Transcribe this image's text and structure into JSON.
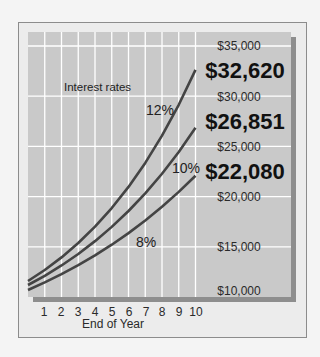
{
  "chart_data": {
    "type": "line",
    "title": "",
    "xlabel": "End of Year",
    "ylabel": "",
    "annotation": "Interest rates",
    "x": [
      0,
      1,
      2,
      3,
      4,
      5,
      6,
      7,
      8,
      9,
      10
    ],
    "x_tick_labels": [
      "1",
      "2",
      "3",
      "4",
      "5",
      "6",
      "7",
      "8",
      "9",
      "10"
    ],
    "ylim": [
      10000,
      35000
    ],
    "y_tick_labels": [
      "$35,000",
      "$30,000",
      "$25,000",
      "$20,000",
      "$15,000",
      "$10,000"
    ],
    "y_ticks": [
      35000,
      30000,
      25000,
      20000,
      15000,
      10000
    ],
    "grid": true,
    "series": [
      {
        "name": "12%",
        "values": [
          10000,
          11255,
          12668,
          14258,
          16047,
          18061,
          20328,
          22879,
          25751,
          28983,
          32620
        ],
        "final_label": "$32,620"
      },
      {
        "name": "10%",
        "values": [
          10000,
          11038,
          12184,
          13449,
          14845,
          16386,
          18087,
          19965,
          22038,
          24325,
          26851
        ],
        "final_label": "$26,851"
      },
      {
        "name": "8%",
        "values": [
          10000,
          10824,
          11717,
          12682,
          13728,
          14859,
          16084,
          17410,
          18845,
          20399,
          22080
        ],
        "final_label": "$22,080"
      }
    ]
  },
  "colors": {
    "plot_bg": "#c9c9c9",
    "grid": "#ffffff",
    "line": "#444444",
    "shadow": "#8e8e8e",
    "frame_bg": "#ececec"
  }
}
